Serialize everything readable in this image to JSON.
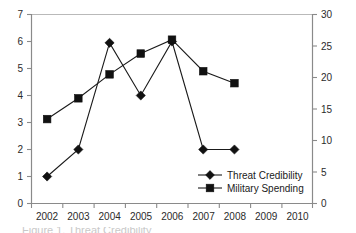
{
  "chart_data": {
    "type": "line",
    "title": "",
    "xlabel": "",
    "ylabel": "",
    "grid": false,
    "legend_position": "inside-bottom-right",
    "x": [
      2002,
      2003,
      2004,
      2005,
      2006,
      2007,
      2008,
      2009,
      2010
    ],
    "xtick_labels": [
      "2002",
      "2003",
      "2004",
      "2005",
      "2006",
      "2007",
      "2008",
      "2009",
      "2010"
    ],
    "xlim": [
      2001.5,
      2010.5
    ],
    "left_axis": {
      "label": "",
      "ylim": [
        0,
        7
      ],
      "ticks": [
        0,
        1,
        2,
        3,
        4,
        5,
        6,
        7
      ],
      "tick_labels": [
        "0",
        "1",
        "2",
        "3",
        "4",
        "5",
        "6",
        "7"
      ]
    },
    "right_axis": {
      "label": "",
      "ylim": [
        0,
        30
      ],
      "ticks": [
        0,
        5,
        10,
        15,
        20,
        25,
        30
      ],
      "tick_labels": [
        "0",
        "5",
        "10",
        "15",
        "20",
        "25",
        "30"
      ]
    },
    "series": [
      {
        "name": "Threat Credibility",
        "marker": "diamond",
        "axis": "left",
        "x": [
          2002,
          2003,
          2004,
          2005,
          2006,
          2007,
          2008
        ],
        "values": [
          1.0,
          2.0,
          5.95,
          4.0,
          6.0,
          2.0,
          2.0
        ]
      },
      {
        "name": "Military Spending",
        "marker": "square",
        "axis": "right",
        "x": [
          2002,
          2003,
          2004,
          2005,
          2006,
          2007,
          2008
        ],
        "values": [
          13.4,
          16.7,
          20.5,
          23.8,
          26.0,
          21.0,
          19.1
        ]
      }
    ],
    "colors": {
      "series_line": "#1a1a1a",
      "marker": "#111111",
      "axis": "#8a8a8a",
      "tick_text": "#2b2b2b",
      "background": "#ffffff"
    }
  },
  "legend": {
    "entries": [
      {
        "label": "Threat Credibility",
        "marker": "diamond"
      },
      {
        "label": "Military Spending",
        "marker": "square"
      }
    ]
  },
  "caption": {
    "text": "Figure 1. Threat Credibility"
  }
}
